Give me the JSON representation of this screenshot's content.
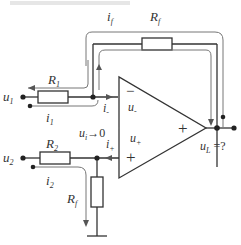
{
  "header": {
    "cropped_caption": ""
  },
  "labels": {
    "if": {
      "main": "i",
      "sub": "f"
    },
    "rf_top": {
      "main": "R",
      "sub": "f"
    },
    "r1": {
      "main": "R",
      "sub": "1"
    },
    "u1": {
      "main": "u",
      "sub": "1"
    },
    "i1": {
      "main": "i",
      "sub": "1"
    },
    "i_minus": {
      "main": "i",
      "sub": "-"
    },
    "u_minus": {
      "main": "u",
      "sub": "-"
    },
    "minus_sign": "−",
    "ui_zero": {
      "main": "u",
      "sub": "i",
      "rest": "→0"
    },
    "u_plus": {
      "main": "u",
      "sub": "+"
    },
    "i_plus": {
      "main": "i",
      "sub": "+"
    },
    "plus_sign_input": "+",
    "plus_sign_output": "+",
    "u2": {
      "main": "u",
      "sub": "2"
    },
    "r2": {
      "main": "R",
      "sub": "2"
    },
    "i2": {
      "main": "i",
      "sub": "2"
    },
    "rf_bottom": {
      "main": "R",
      "sub": "f"
    },
    "uL": {
      "main": "u",
      "sub": "L",
      "rest": " =?"
    }
  },
  "colors": {
    "line": "#333333",
    "current_arrow": "#666666",
    "background": "#ffffff"
  }
}
